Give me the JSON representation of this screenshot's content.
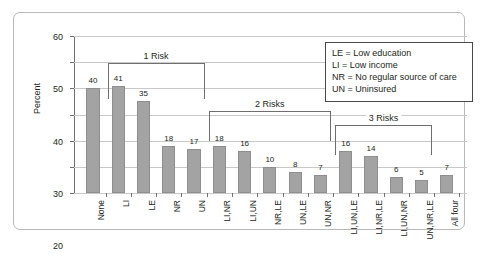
{
  "chart_data": {
    "type": "bar",
    "title": "",
    "xlabel": "",
    "ylabel": "Percent",
    "ylim": [
      0,
      60
    ],
    "yticks": [
      0,
      10,
      20,
      30,
      40,
      50,
      60
    ],
    "grid": true,
    "legend_position": "top-right",
    "categories": [
      "None",
      "LI",
      "LE",
      "NR",
      "UN",
      "LI,NR",
      "LI,UN",
      "NR,LE",
      "UN,LE",
      "UN,NR",
      "LI,UN,LE",
      "LI,NR,LE",
      "LI,UN,NR",
      "UN,NR,LE",
      "All four"
    ],
    "values": [
      40,
      41,
      35,
      18,
      17,
      18,
      16,
      10,
      8,
      7,
      16,
      14,
      6,
      5,
      7
    ],
    "bar_color": "#a3a3a3",
    "annotations": [
      {
        "label": "1 Risk",
        "start_index": 1,
        "end_index": 4
      },
      {
        "label": "2 Risks",
        "start_index": 5,
        "end_index": 9
      },
      {
        "label": "3 Risks",
        "start_index": 10,
        "end_index": 13
      }
    ],
    "legend": [
      "LE = Low education",
      "LI = Low income",
      "NR = No regular source of care",
      "UN = Uninsured"
    ]
  }
}
